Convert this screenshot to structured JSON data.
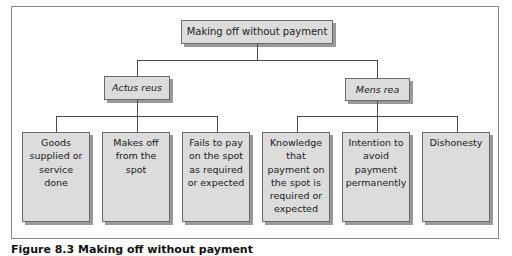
{
  "diagram": {
    "root": {
      "label": "Making off without payment"
    },
    "branches": [
      {
        "label": "Actus reus",
        "style": "italic",
        "children": [
          {
            "label": "Goods\nsupplied or\nservice\ndone"
          },
          {
            "label": "Makes off\nfrom the\nspot"
          },
          {
            "label": "Fails to pay\non the spot\nas required\nor expected"
          }
        ]
      },
      {
        "label": "Mens rea",
        "style": "italic",
        "children": [
          {
            "label": "Knowledge\nthat\npayment on\nthe spot is\nrequired or\nexpected"
          },
          {
            "label": "Intention to\navoid\npayment\npermanently"
          },
          {
            "label": "Dishonesty"
          }
        ]
      }
    ]
  },
  "caption": "Figure 8.3 Making off without payment",
  "colors": {
    "box_fill": "#dcdcdc",
    "box_border": "#6a6a6a",
    "box_shadow": "#9a9a9a",
    "connector": "#4a4a4a",
    "frame": "#8a8a8a"
  }
}
